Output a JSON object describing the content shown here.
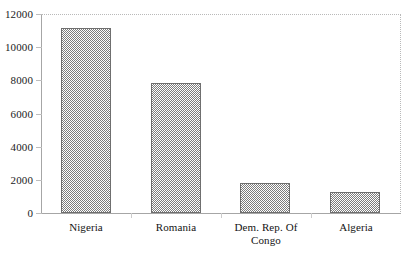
{
  "chart_data": {
    "type": "bar",
    "title": "",
    "subtitle": "",
    "xlabel": "",
    "ylabel": "",
    "categories": [
      "Nigeria",
      "Romania",
      "Dem. Rep. Of Congo",
      "Algeria"
    ],
    "values": [
      11150,
      7850,
      1800,
      1250
    ],
    "series": [
      {
        "name": "",
        "values": [
          11150,
          7850,
          1800,
          1250
        ]
      }
    ],
    "ylim": [
      0,
      12000
    ],
    "ytick_labels": [
      "12000",
      "10000",
      "8000",
      "6000",
      "4000",
      "2000",
      "0"
    ],
    "ytick_values": [
      12000,
      10000,
      8000,
      6000,
      4000,
      2000,
      0
    ],
    "grid": false,
    "legend": null,
    "legend_position": "none",
    "annotations": [],
    "bar_fill": "#7d7d7d",
    "bar_border": "#6f6f6f",
    "axis_color": "#a6a6a6",
    "frame_color": "#b9b9b9",
    "text_color": "#141414"
  },
  "axis": {
    "y_ticks": [
      {
        "label": "12000",
        "value": 12000
      },
      {
        "label": "10000",
        "value": 10000
      },
      {
        "label": "8000",
        "value": 8000
      },
      {
        "label": "6000",
        "value": 6000
      },
      {
        "label": "4000",
        "value": 4000
      },
      {
        "label": "2000",
        "value": 2000
      },
      {
        "label": "0",
        "value": 0
      }
    ],
    "x_categories": [
      {
        "label": "Nigeria",
        "lines": [
          "Nigeria"
        ]
      },
      {
        "label": "Romania",
        "lines": [
          "Romania"
        ]
      },
      {
        "label": "Dem. Rep. Of Congo",
        "lines": [
          "Dem. Rep. Of",
          "Congo"
        ]
      },
      {
        "label": "Algeria",
        "lines": [
          "Algeria"
        ]
      }
    ]
  }
}
